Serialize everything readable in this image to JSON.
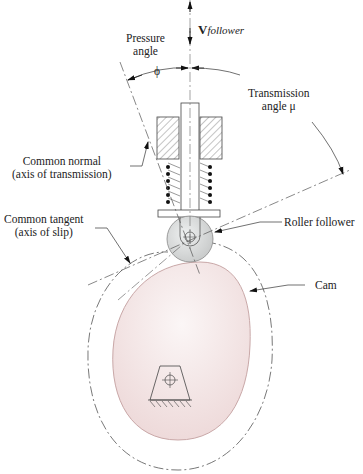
{
  "labels": {
    "v_follower_main": "V",
    "v_follower_sub": "follower",
    "pressure_angle_line1": "Pressure",
    "pressure_angle_line2": "angle",
    "phi": "ϕ",
    "transmission_line1": "Transmission",
    "transmission_line2": "angle μ",
    "common_normal_line1": "Common normal",
    "common_normal_line2": "(axis of transmission)",
    "common_tangent_line1": "Common tangent",
    "common_tangent_line2": "(axis of slip)",
    "roller_follower": "Roller follower",
    "cam": "Cam"
  },
  "colors": {
    "cam_fill": "#f1dede",
    "cam_stroke": "#c9a8a8",
    "roller_fill": "#d4d6d6",
    "line": "#333333",
    "hatch": "#555555"
  }
}
